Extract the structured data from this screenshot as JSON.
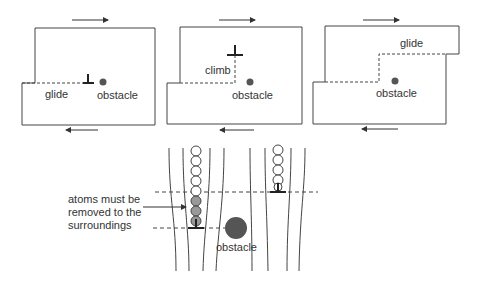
{
  "panels": [
    {
      "id": "panel-glide",
      "label": "glide",
      "obstacle_label": "obstacle"
    },
    {
      "id": "panel-climb",
      "label": "climb",
      "obstacle_label": "obstacle"
    },
    {
      "id": "panel-glide-after",
      "label": "glide",
      "obstacle_label": "obstacle"
    }
  ],
  "bottom": {
    "annotation": [
      "atoms must be",
      "removed to the",
      "surroundings"
    ],
    "obstacle_label": "obstacle"
  },
  "colors": {
    "line": "#444444",
    "obstacle": "#555555",
    "atom_removed": "#999999",
    "atom_fill": "#ffffff"
  }
}
